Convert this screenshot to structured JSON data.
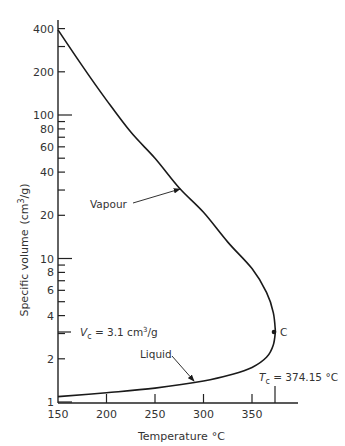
{
  "chart_data": {
    "type": "line",
    "title": "",
    "xlabel": "Temperature °C",
    "ylabel": "Specific volume (cm³/g)",
    "x_scale": "linear",
    "y_scale": "log",
    "xlim": [
      150,
      380
    ],
    "ylim": [
      1,
      400
    ],
    "grid": false,
    "legend": "none",
    "x_ticks": [
      150,
      200,
      250,
      300,
      350
    ],
    "x_tick_labels": [
      "150",
      "200",
      "250",
      "300",
      "350"
    ],
    "y_ticks": [
      1,
      2,
      3,
      4,
      5,
      6,
      7,
      8,
      9,
      10,
      20,
      30,
      40,
      50,
      60,
      70,
      80,
      90,
      100,
      200,
      300,
      400
    ],
    "y_tick_labels": [
      {
        "value": 1,
        "label": "1"
      },
      {
        "value": 2,
        "label": "2"
      },
      {
        "value": 4,
        "label": "4"
      },
      {
        "value": 6,
        "label": "6"
      },
      {
        "value": 8,
        "label": "8"
      },
      {
        "value": 10,
        "label": "10"
      },
      {
        "value": 20,
        "label": "20"
      },
      {
        "value": 40,
        "label": "40"
      },
      {
        "value": 60,
        "label": "60"
      },
      {
        "value": 80,
        "label": "80"
      },
      {
        "value": 100,
        "label": "100"
      },
      {
        "value": 200,
        "label": "200"
      },
      {
        "value": 400,
        "label": "400"
      }
    ],
    "series": [
      {
        "name": "Vapour",
        "x": [
          150,
          175,
          200,
          225,
          250,
          275,
          300,
          325,
          350,
          365,
          372,
          374.15
        ],
        "values": [
          392,
          220,
          127,
          76,
          50,
          31,
          21,
          13,
          8.5,
          5.8,
          4.2,
          3.1
        ]
      },
      {
        "name": "Liquid",
        "x": [
          150,
          200,
          250,
          300,
          330,
          350,
          365,
          372,
          374.15
        ],
        "values": [
          1.09,
          1.16,
          1.25,
          1.4,
          1.56,
          1.74,
          2.05,
          2.5,
          3.1
        ]
      }
    ],
    "annotations": [
      {
        "text": "Vapour",
        "arrow_to": {
          "x": 275,
          "y": 31
        }
      },
      {
        "text": "Liquid",
        "arrow_to": {
          "x": 290,
          "y": 1.37
        }
      },
      {
        "text": "C",
        "point": {
          "x": 374.15,
          "y": 3.1
        },
        "marker": "dot"
      },
      {
        "text": "Vc = 3.1 cm³/g",
        "axis": "y",
        "value": 3.1
      },
      {
        "text": "Tc = 374.15 °C",
        "axis": "x",
        "value": 374.15
      }
    ]
  },
  "labels": {
    "xlabel_main": "Temperature",
    "xlabel_unit": "°C",
    "ylabel_main": "Specific volume",
    "ylabel_unit_open": "(cm",
    "ylabel_unit_sup": "3",
    "ylabel_unit_close": "/g)",
    "vapour": "Vapour",
    "liquid": "Liquid",
    "critical_point": "C",
    "vc_symbol": "V",
    "vc_sub": "c",
    "vc_value": " = 3.1 cm",
    "vc_sup": "3",
    "vc_unit": "/g",
    "tc_symbol": "T",
    "tc_sub": "c",
    "tc_value": " = 374.15 °C"
  },
  "colors": {
    "line": "#1a1a1a",
    "axis": "#222222",
    "text": "#333333"
  }
}
